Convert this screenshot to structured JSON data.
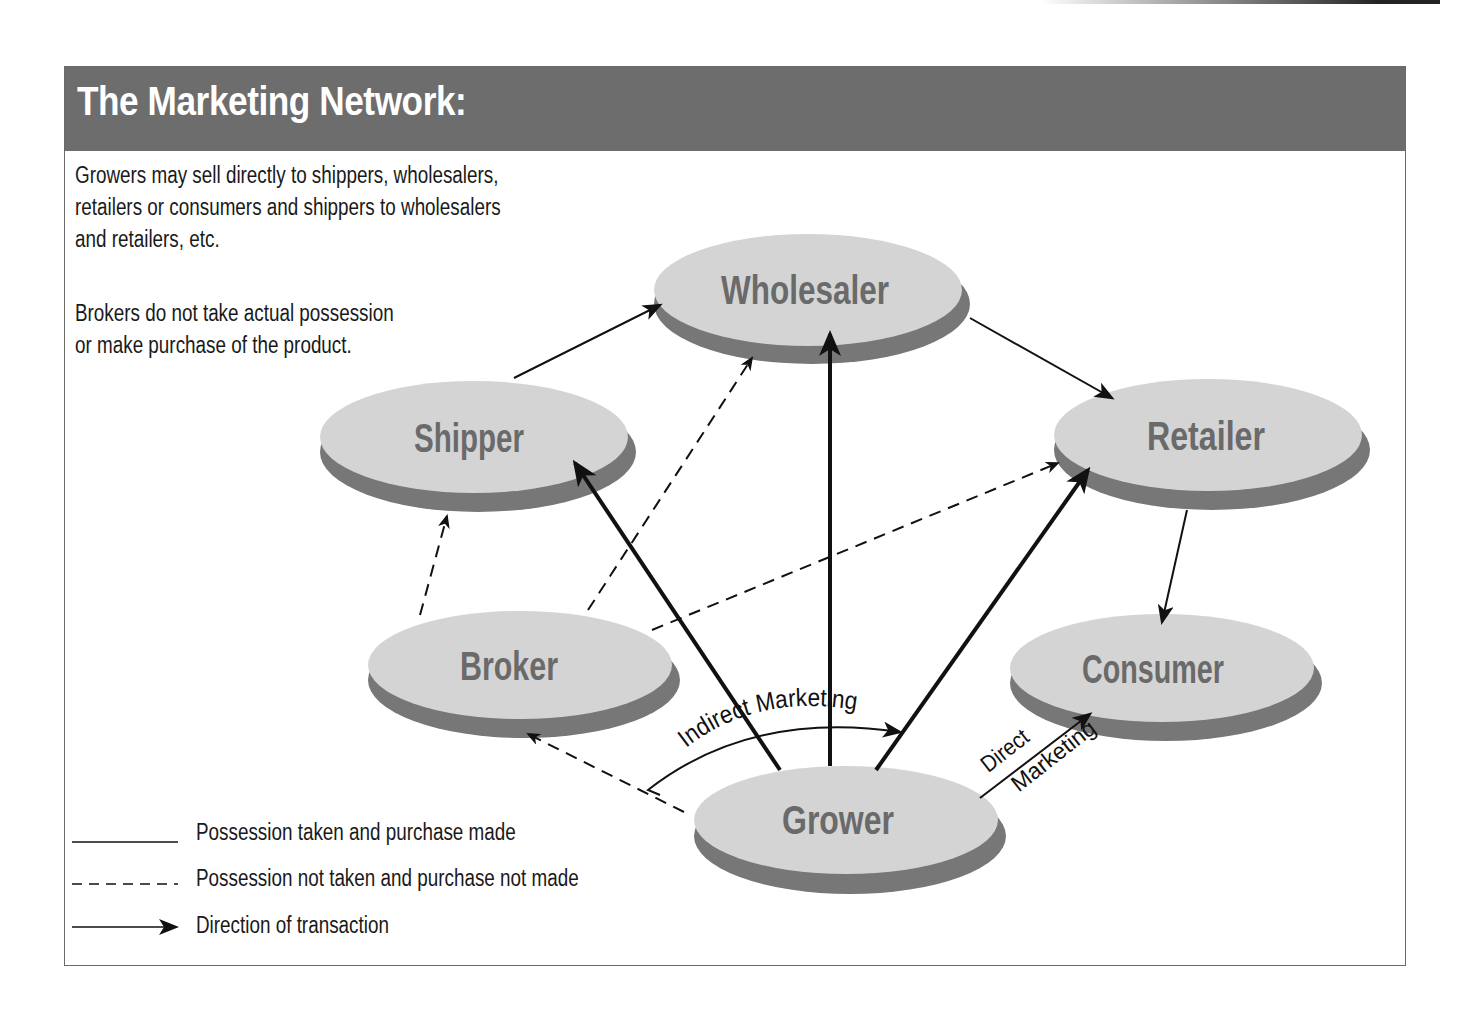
{
  "title": "The Marketing Network:",
  "description": {
    "paragraph1": [
      "Growers may sell directly to shippers, wholesalers,",
      "retailers or consumers and shippers to wholesalers",
      "and retailers, etc."
    ],
    "paragraph2": [
      "Brokers do not take actual possession",
      "or make purchase of the product."
    ]
  },
  "nodes": {
    "wholesaler": "Wholesaler",
    "shipper": "Shipper",
    "retailer": "Retailer",
    "broker": "Broker",
    "consumer": "Consumer",
    "grower": "Grower"
  },
  "annotations": {
    "indirect": "Indirect Marketing",
    "direct_line1": "Direct",
    "direct_line2": "Marketing"
  },
  "legend": [
    {
      "style": "solid",
      "label": "Possession taken and purchase made"
    },
    {
      "style": "dashed",
      "label": "Possession not taken and purchase not made"
    },
    {
      "style": "arrow",
      "label": "Direction of transaction"
    }
  ],
  "colors": {
    "title_bar": "#6d6d6d",
    "node_top": "#d4d4d4",
    "node_side": "#777777",
    "node_text": "#6a6a6a"
  },
  "edges": [
    {
      "from": "Shipper",
      "to": "Wholesaler",
      "style": "solid"
    },
    {
      "from": "Wholesaler",
      "to": "Retailer",
      "style": "solid"
    },
    {
      "from": "Retailer",
      "to": "Consumer",
      "style": "solid"
    },
    {
      "from": "Grower",
      "to": "Shipper",
      "style": "solid-bold"
    },
    {
      "from": "Grower",
      "to": "Wholesaler",
      "style": "solid-bold"
    },
    {
      "from": "Grower",
      "to": "Retailer",
      "style": "solid-bold"
    },
    {
      "from": "Grower",
      "to": "Consumer",
      "style": "solid"
    },
    {
      "from": "Broker",
      "to": "Shipper",
      "style": "dashed"
    },
    {
      "from": "Broker",
      "to": "Wholesaler",
      "style": "dashed"
    },
    {
      "from": "Broker",
      "to": "Retailer",
      "style": "dashed"
    },
    {
      "from": "Grower",
      "to": "Broker",
      "style": "dashed"
    }
  ]
}
